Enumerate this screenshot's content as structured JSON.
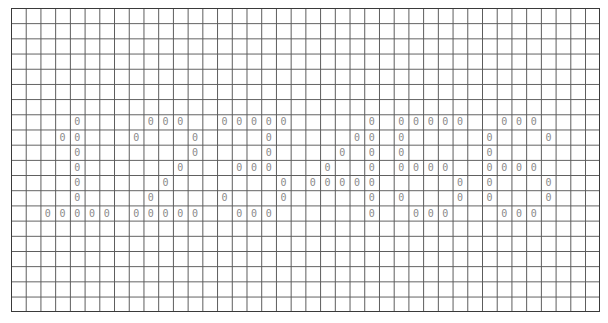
{
  "grid": {
    "columns": 40,
    "rows": 20,
    "line_color": "#5a5a5a",
    "digit_color": "#8a8a8a",
    "symbol": "0",
    "cells": {
      "7": [
        4,
        9,
        10,
        11,
        14,
        15,
        16,
        17,
        18,
        24,
        26,
        27,
        28,
        29,
        30,
        33,
        34,
        35
      ],
      "8": [
        3,
        4,
        8,
        12,
        17,
        23,
        24,
        26,
        32,
        36
      ],
      "9": [
        4,
        12,
        17,
        22,
        24,
        26,
        32
      ],
      "10": [
        4,
        11,
        15,
        16,
        17,
        21,
        24,
        26,
        27,
        28,
        29,
        32,
        33,
        34,
        35
      ],
      "11": [
        4,
        10,
        18,
        20,
        21,
        22,
        23,
        24,
        30,
        32,
        36
      ],
      "12": [
        4,
        9,
        14,
        18,
        24,
        26,
        30,
        32,
        36
      ],
      "13": [
        2,
        3,
        4,
        5,
        6,
        8,
        9,
        10,
        11,
        12,
        15,
        16,
        17,
        24,
        27,
        28,
        29,
        33,
        34,
        35
      ]
    },
    "rendered_text_rows": [
      "1  2  5  4  5  8  5  9  5",
      "encoded digits 12545859 drawn with 0 glyphs"
    ]
  }
}
